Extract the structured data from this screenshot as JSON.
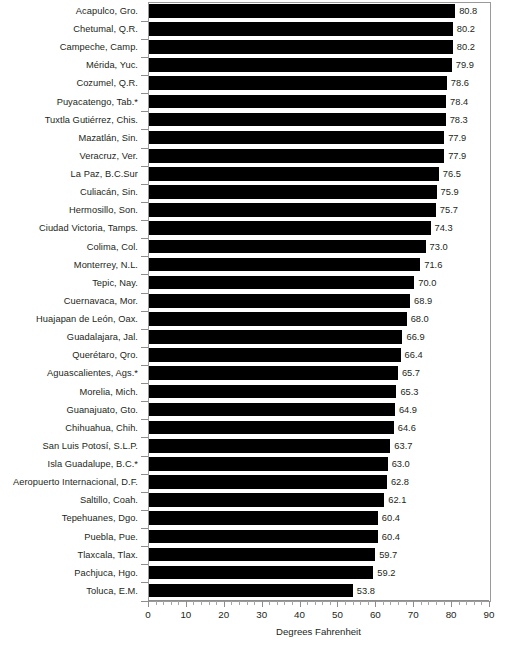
{
  "chart_data": {
    "type": "bar",
    "orientation": "horizontal",
    "title": "",
    "subtitle": "",
    "xlabel": "Degrees Fahrenheit",
    "ylabel": "",
    "xlim": [
      0,
      90
    ],
    "xticks": [
      0,
      10,
      20,
      30,
      40,
      50,
      60,
      70,
      80,
      90
    ],
    "xtick_labels": [
      "0",
      "10",
      "20",
      "30",
      "40",
      "50",
      "60",
      "70",
      "80",
      "90"
    ],
    "minor_tick_step": 2,
    "grid": false,
    "legend": null,
    "bar_color": "#000000",
    "data_labels": true,
    "categories": [
      "Acapulco, Gro.",
      "Chetumal, Q.R.",
      "Campeche, Camp.",
      "Mérida, Yuc.",
      "Cozumel, Q.R.",
      "Puyacatengo, Tab.*",
      "Tuxtla Gutiérrez, Chis.",
      "Mazatlán, Sin.",
      "Veracruz, Ver.",
      "La Paz, B.C.Sur",
      "Culiacán, Sin.",
      "Hermosillo, Son.",
      "Ciudad Victoria, Tamps.",
      "Colima, Col.",
      "Monterrey, N.L.",
      "Tepic, Nay.",
      "Cuernavaca, Mor.",
      "Huajapan de León, Oax.",
      "Guadalajara, Jal.",
      "Querétaro, Qro.",
      "Aguascalientes, Ags.*",
      "Morelia, Mich.",
      "Guanajuato, Gto.",
      "Chihuahua, Chih.",
      "San Luis Potosí, S.L.P.",
      "Isla Guadalupe, B.C.*",
      "Aeropuerto Internacional, D.F.",
      "Saltillo, Coah.",
      "Tepehuanes, Dgo.",
      "Puebla, Pue.",
      "Tlaxcala, Tlax.",
      "Pachjuca, Hgo.",
      "Toluca, E.M."
    ],
    "values": [
      80.8,
      80.2,
      80.2,
      79.9,
      78.6,
      78.4,
      78.3,
      77.9,
      77.9,
      76.5,
      75.9,
      75.7,
      74.3,
      73.0,
      71.6,
      70.0,
      68.9,
      68.0,
      66.9,
      66.4,
      65.7,
      65.3,
      64.9,
      64.6,
      63.7,
      63.0,
      62.8,
      62.1,
      60.4,
      60.4,
      59.7,
      59.2,
      53.8
    ],
    "value_labels": [
      "80.8",
      "80.2",
      "80.2",
      "79.9",
      "78.6",
      "78.4",
      "78.3",
      "77.9",
      "77.9",
      "76.5",
      "75.9",
      "75.7",
      "74.3",
      "73.0",
      "71.6",
      "70.0",
      "68.9",
      "68.0",
      "66.9",
      "66.4",
      "65.7",
      "65.3",
      "64.9",
      "64.6",
      "63.7",
      "63.0",
      "62.8",
      "62.1",
      "60.4",
      "60.4",
      "59.7",
      "59.2",
      "53.8"
    ]
  }
}
